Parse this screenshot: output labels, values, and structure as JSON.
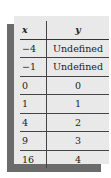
{
  "table": {
    "headers": {
      "x": "x",
      "y": "y"
    },
    "rows": [
      {
        "x": "−4",
        "y": "Undefined"
      },
      {
        "x": "−1",
        "y": "Undefined"
      },
      {
        "x": "0",
        "y": "0"
      },
      {
        "x": "1",
        "y": "1"
      },
      {
        "x": "4",
        "y": "2"
      },
      {
        "x": "9",
        "y": "3"
      },
      {
        "x": "16",
        "y": "4"
      }
    ]
  },
  "colors": {
    "panel": "#e9e9e9",
    "shadow": "#6b6b6b"
  }
}
